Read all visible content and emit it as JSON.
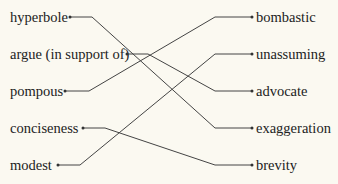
{
  "diagram": {
    "type": "matching",
    "left_terms": [
      "hyperbole",
      "argue (in support of)",
      "pompous",
      "conciseness",
      "modest"
    ],
    "right_terms": [
      "bombastic",
      "unassuming",
      "advocate",
      "exaggeration",
      "brevity"
    ],
    "connections": [
      {
        "from": "hyperbole",
        "to": "exaggeration"
      },
      {
        "from": "argue (in support of)",
        "to": "advocate"
      },
      {
        "from": "pompous",
        "to": "bombastic"
      },
      {
        "from": "conciseness",
        "to": "brevity"
      },
      {
        "from": "modest",
        "to": "unassuming"
      }
    ],
    "line_color": "#444444",
    "background": "#fbf9f1"
  }
}
